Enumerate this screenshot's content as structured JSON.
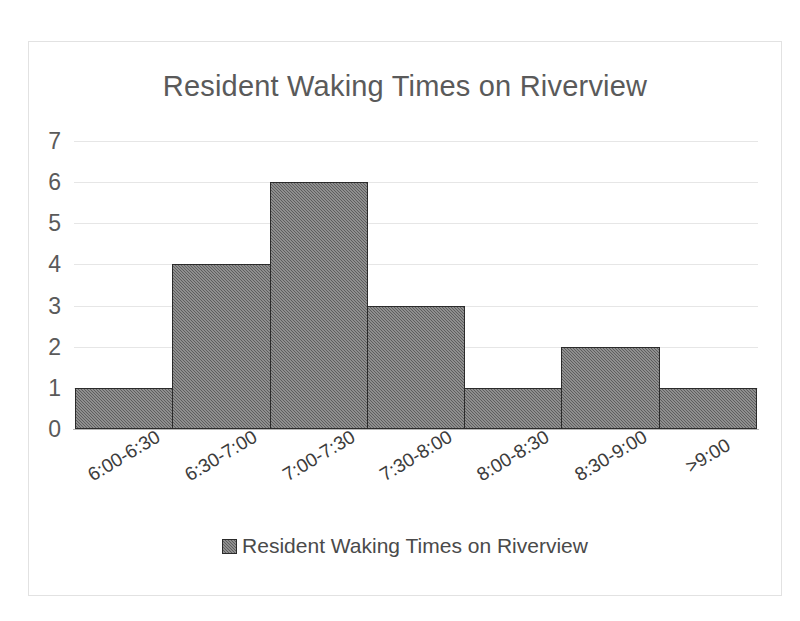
{
  "chart_data": {
    "type": "bar",
    "title": "Resident Waking Times on Riverview",
    "categories": [
      "6:00-6:30",
      "6:30-7:00",
      "7:00-7:30",
      "7:30-8:00",
      "8:00-8:30",
      "8:30-9:00",
      ">9:00"
    ],
    "values": [
      1,
      4,
      6,
      3,
      1,
      2,
      1
    ],
    "series": [
      {
        "name": "Resident Waking Times on Riverview",
        "values": [
          1,
          4,
          6,
          3,
          1,
          2,
          1
        ]
      }
    ],
    "xlabel": "",
    "ylabel": "",
    "ylim": [
      0,
      7
    ],
    "y_ticks": [
      0,
      1,
      2,
      3,
      4,
      5,
      6,
      7
    ],
    "y_tick_labels": [
      "0",
      "1",
      "2",
      "3",
      "4",
      "5",
      "6",
      "7"
    ],
    "grid": true,
    "grid_axis": "y",
    "legend": {
      "position": "bottom",
      "entries": [
        "Resident Waking Times on Riverview"
      ],
      "swatch_icon": "filled-square-icon"
    },
    "bar_style": {
      "fill_color": "#5e5e5e",
      "edge_color": "#2b2b2b",
      "pattern": "halftone-dither",
      "gap": 0
    },
    "x_tick_rotation_deg": -31,
    "colors": {
      "title": "#5a5a5a",
      "tick_label": "#5a5a5a",
      "category_label": "#3c3c3c",
      "gridline": "#e6e6e6",
      "axis": "#b5b5b5",
      "frame": "#e2e2e2",
      "background": "#ffffff"
    }
  }
}
